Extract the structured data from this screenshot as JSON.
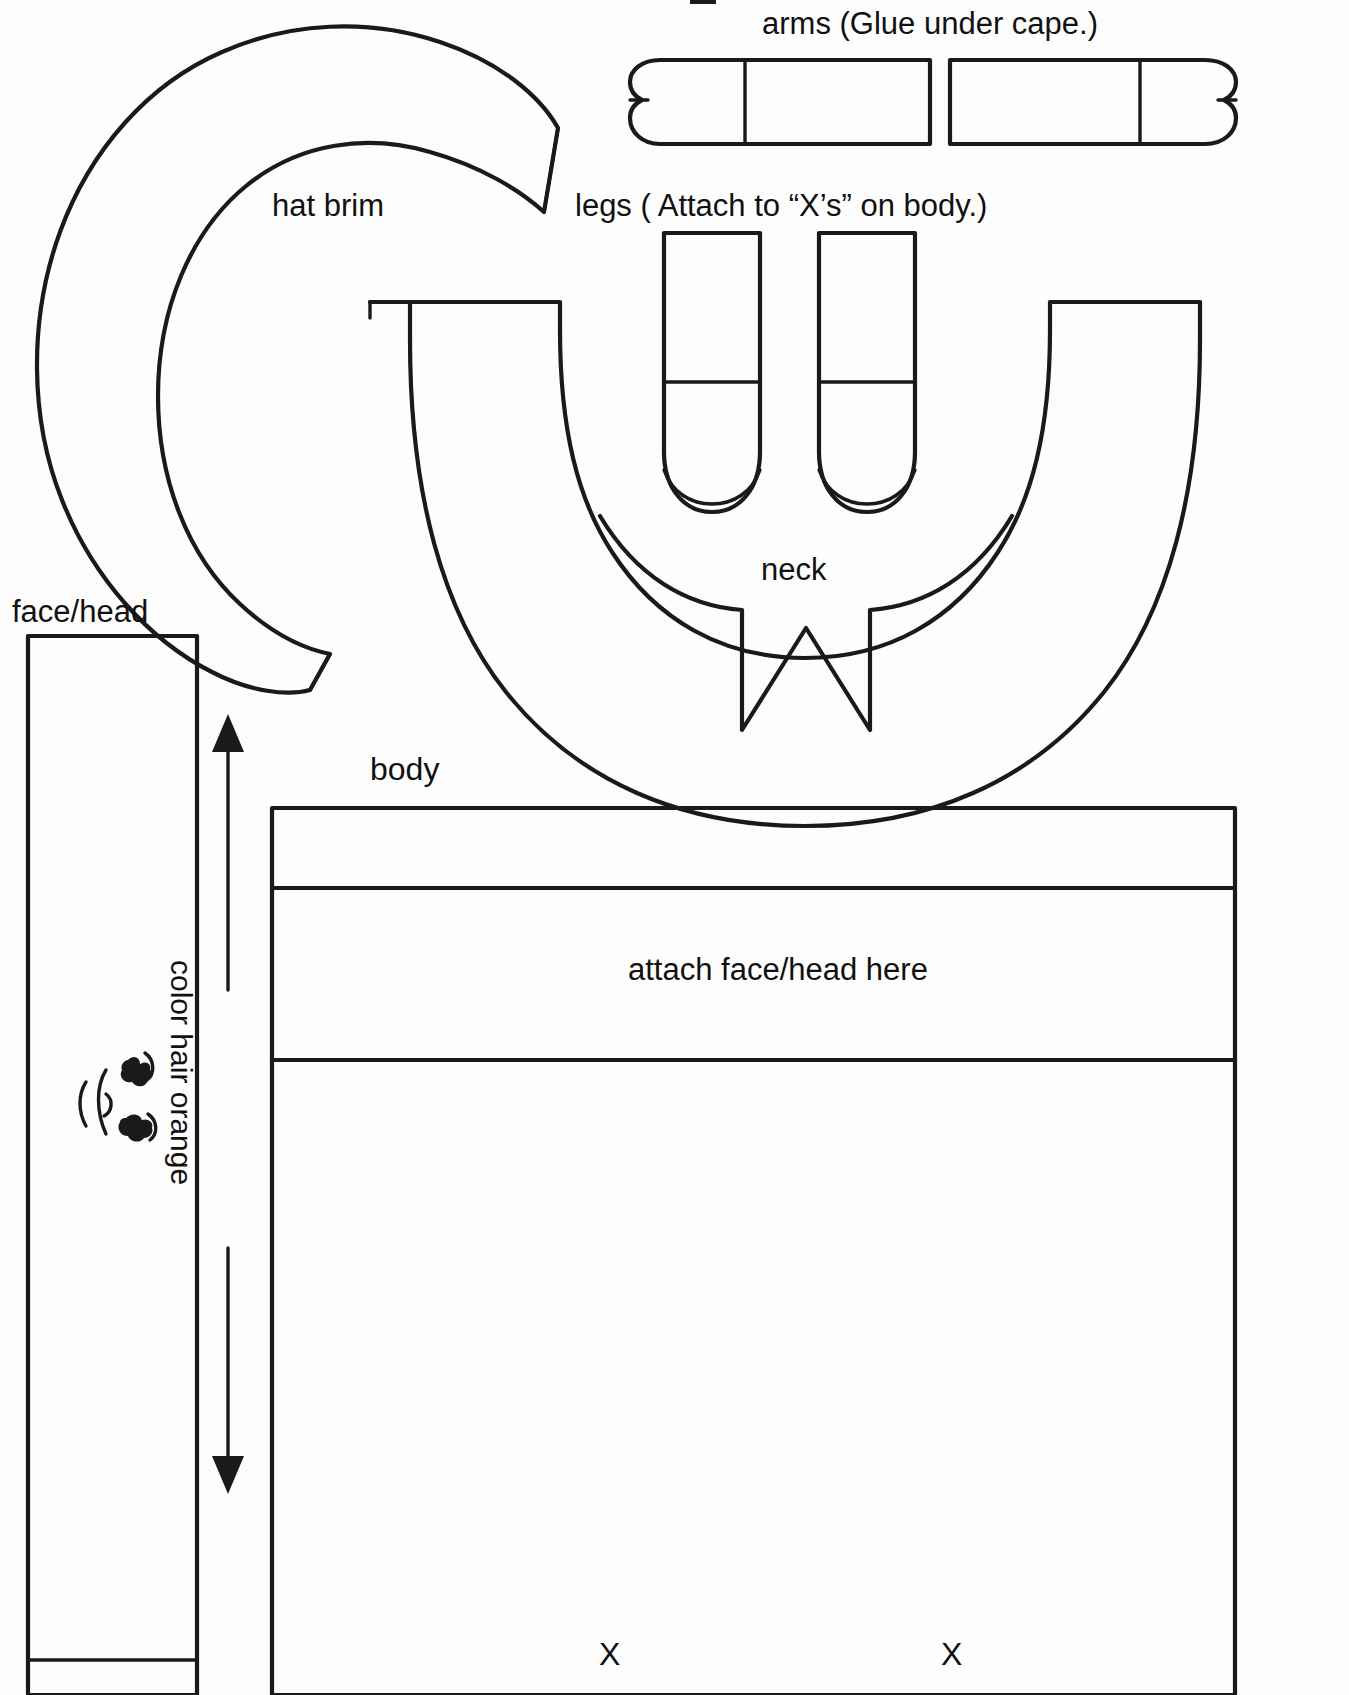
{
  "page": {
    "background_color": "#fdfdfd",
    "ink_color": "#1a1a1a",
    "width": 1349,
    "height": 1695
  },
  "labels": {
    "arms": "arms (Glue under cape.)",
    "hat_brim": "hat brim",
    "legs": "legs ( Attach to “X’s” on body.)",
    "face_head": "face/head",
    "neck": "neck",
    "body": "body",
    "color_hair_orange": "color hair orange",
    "attach_face_head_here": "attach face/head here",
    "x_left": "X",
    "x_right": "X"
  },
  "pieces": [
    {
      "name": "hat-brim",
      "label": "hat brim"
    },
    {
      "name": "arm-left",
      "label": "arms (Glue under cape.)"
    },
    {
      "name": "arm-right",
      "label": "arms (Glue under cape.)"
    },
    {
      "name": "leg-left",
      "label": "legs ( Attach to “X’s” on body.)"
    },
    {
      "name": "leg-right",
      "label": "legs ( Attach to “X’s” on body.)"
    },
    {
      "name": "cape-neck",
      "label": "neck"
    },
    {
      "name": "face-head-strip",
      "label": "face/head"
    },
    {
      "name": "body-panel",
      "label": "body"
    }
  ]
}
